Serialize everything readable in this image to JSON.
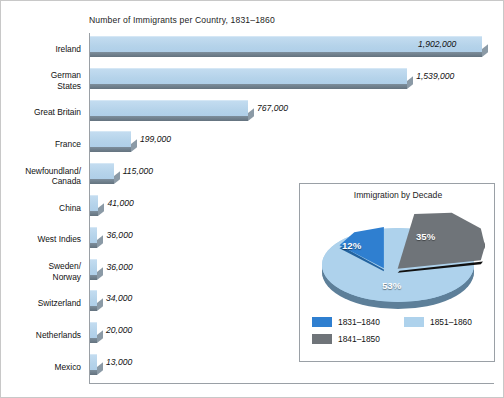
{
  "chart_data": {
    "type": "bar",
    "title": "Number of Immigrants per Country, 1831–1860",
    "orientation": "horizontal",
    "xlabel": "",
    "ylabel": "",
    "xlim": [
      0,
      2000000
    ],
    "grid": false,
    "categories": [
      "Ireland",
      "German\nStates",
      "Great Britain",
      "France",
      "Newfoundland/\nCanada",
      "China",
      "West Indies",
      "Sweden/\nNorway",
      "Switzerland",
      "Netherlands",
      "Mexico"
    ],
    "values": [
      1902000,
      1539000,
      767000,
      199000,
      115000,
      41000,
      36000,
      36000,
      34000,
      20000,
      13000
    ],
    "value_labels": [
      "1,902,000",
      "1,539,000",
      "767,000",
      "199,000",
      "115,000",
      "41,000",
      "36,000",
      "36,000",
      "34,000",
      "20,000",
      "13,000"
    ],
    "bar_color": "#b5d3ea",
    "bar_shadow_color": "#64737f",
    "axis_color": "#9aa0a6"
  },
  "inset_chart": {
    "type": "pie",
    "title": "Immigration by Decade",
    "labels": [
      "1831–1840",
      "1841–1850",
      "1851–1860"
    ],
    "values": [
      12,
      35,
      53
    ],
    "value_labels": [
      "12%",
      "35%",
      "53%"
    ],
    "colors": [
      "#2f7fd0",
      "#6f7479",
      "#aed2ec"
    ],
    "exploded": [
      "1841–1850"
    ],
    "legend_position": "bottom",
    "legend": [
      {
        "label": "1831–1840",
        "color": "#2f7fd0"
      },
      {
        "label": "1851–1860",
        "color": "#aed2ec"
      },
      {
        "label": "1841–1850",
        "color": "#6f7479"
      }
    ]
  }
}
